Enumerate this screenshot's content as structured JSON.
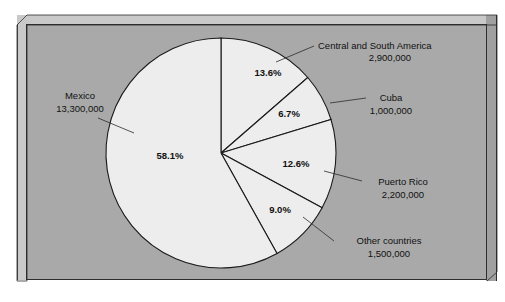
{
  "figure": {
    "background_color": "#ffffff",
    "panel_color": "#a9a9a9",
    "slab_edge_color": "#c9c9c9",
    "border_color": "#2e2e2e"
  },
  "chart_data": {
    "type": "pie",
    "title": "",
    "subtitle": "",
    "xlabel": "",
    "ylabel": "",
    "grid": false,
    "legend_position": "callout-labels",
    "start_angle_deg": 0,
    "direction": "clockwise",
    "slice_fill_color": "#ededed",
    "slice_outline_color": "#1a1a1a",
    "categories": [
      "Central and South America",
      "Cuba",
      "Puerto Rico",
      "Other countries",
      "Mexico"
    ],
    "percentages": [
      13.6,
      6.7,
      12.6,
      9.0,
      58.1
    ],
    "values": [
      2900000,
      1000000,
      2200000,
      1500000,
      13300000
    ],
    "value_labels": [
      "2,900,000",
      "1,000,000",
      "2,200,000",
      "1,500,000",
      "13,300,000"
    ],
    "percent_labels": [
      "13.6%",
      "6.7%",
      "12.6%",
      "9.0%",
      "58.1%"
    ],
    "slices": [
      {
        "name": "Central and South America",
        "percent": 13.6,
        "percent_label": "13.6%",
        "value": 2900000,
        "value_label": "2,900,000",
        "callout_line1": "Central and South America",
        "callout_line2": "2,900,000"
      },
      {
        "name": "Cuba",
        "percent": 6.7,
        "percent_label": "6.7%",
        "value": 1000000,
        "value_label": "1,000,000",
        "callout_line1": "Cuba",
        "callout_line2": "1,000,000"
      },
      {
        "name": "Puerto Rico",
        "percent": 12.6,
        "percent_label": "12.6%",
        "value": 2200000,
        "value_label": "2,200,000",
        "callout_line1": "Puerto Rico",
        "callout_line2": "2,200,000"
      },
      {
        "name": "Other countries",
        "percent": 9.0,
        "percent_label": "9.0%",
        "value": 1500000,
        "value_label": "1,500,000",
        "callout_line1": "Other countries",
        "callout_line2": "1,500,000"
      },
      {
        "name": "Mexico",
        "percent": 58.1,
        "percent_label": "58.1%",
        "value": 13300000,
        "value_label": "13,300,000",
        "callout_line1": "Mexico",
        "callout_line2": "13,300,000"
      }
    ]
  }
}
